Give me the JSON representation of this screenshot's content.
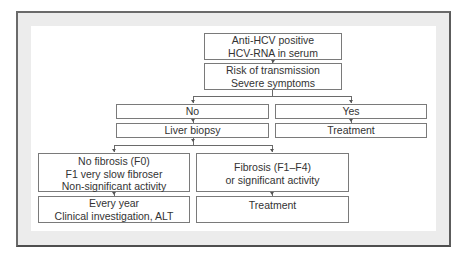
{
  "diagram": {
    "type": "flowchart",
    "colors": {
      "frame_border": "#6a6a6a",
      "frame_fill": "#ececec",
      "box_border": "#7a7a7a",
      "text": "#333333"
    },
    "nodes": {
      "start": {
        "lines": [
          "Anti-HCV positive",
          "HCV-RNA in serum"
        ]
      },
      "risk": {
        "lines": [
          "Risk of transmission",
          "Severe symptoms"
        ]
      },
      "no": {
        "lines": [
          "No"
        ]
      },
      "yes": {
        "lines": [
          "Yes"
        ]
      },
      "biopsy": {
        "lines": [
          "Liver biopsy"
        ]
      },
      "treatment_yes": {
        "lines": [
          "Treatment"
        ]
      },
      "no_fibrosis": {
        "lines": [
          "No fibrosis (F0)",
          "F1 very slow fibroser",
          "Non-significant activity"
        ]
      },
      "fibrosis": {
        "lines": [
          "Fibrosis (F1–F4)",
          "or significant activity"
        ]
      },
      "every_year": {
        "lines": [
          "Every year",
          "Clinical investigation, ALT"
        ]
      },
      "treatment_fibrosis": {
        "lines": [
          "Treatment"
        ]
      }
    },
    "edges": [
      [
        "start",
        "risk"
      ],
      [
        "risk",
        "no"
      ],
      [
        "risk",
        "yes"
      ],
      [
        "no",
        "biopsy"
      ],
      [
        "yes",
        "treatment_yes"
      ],
      [
        "biopsy",
        "no_fibrosis"
      ],
      [
        "biopsy",
        "fibrosis"
      ],
      [
        "no_fibrosis",
        "every_year"
      ],
      [
        "fibrosis",
        "treatment_fibrosis"
      ]
    ]
  }
}
